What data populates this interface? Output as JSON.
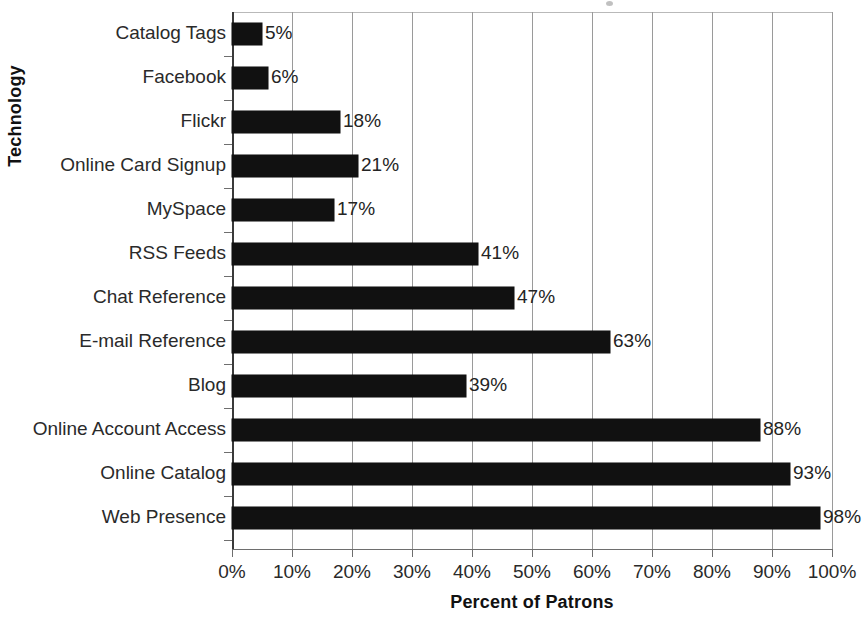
{
  "chart_data": {
    "type": "bar",
    "orientation": "horizontal",
    "title": "",
    "xlabel": "Percent of Patrons",
    "ylabel": "Technology",
    "xlim": [
      0,
      100
    ],
    "xticks": [
      "0%",
      "10%",
      "20%",
      "30%",
      "40%",
      "50%",
      "60%",
      "70%",
      "80%",
      "90%",
      "100%"
    ],
    "grid": "vertical",
    "legend": "none",
    "value_label_suffix": "%",
    "categories": [
      "Catalog Tags",
      "Facebook",
      "Flickr",
      "Online Card Signup",
      "MySpace",
      "RSS Feeds",
      "Chat Reference",
      "E-mail Reference",
      "Blog",
      "Online Account Access",
      "Online Catalog",
      "Web Presence"
    ],
    "values": [
      5,
      6,
      18,
      21,
      17,
      41,
      47,
      63,
      39,
      88,
      93,
      98
    ],
    "value_labels": [
      "5%",
      "6%",
      "18%",
      "21%",
      "17%",
      "41%",
      "47%",
      "63%",
      "39%",
      "88%",
      "93%",
      "98%"
    ],
    "bar_color": "#111111",
    "gridline_color": "#9a9a9a",
    "axis_color": "#6e6e6e"
  }
}
